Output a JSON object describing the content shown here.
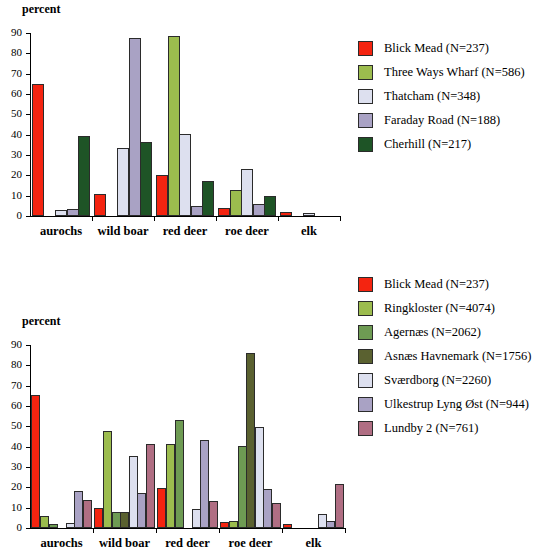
{
  "chart_data": [
    {
      "id": "top",
      "type": "bar",
      "title": "",
      "ylabel": "percent",
      "xlabel": "",
      "ylim": [
        0,
        90
      ],
      "yticks": [
        0,
        10,
        20,
        30,
        40,
        50,
        60,
        70,
        80,
        90
      ],
      "grid": false,
      "legend_position": "right",
      "categories": [
        "aurochs",
        "wild boar",
        "red deer",
        "roe deer",
        "elk"
      ],
      "series": [
        {
          "name": "Blick Mead (N=237)",
          "color": "#f42410",
          "values": [
            65,
            11,
            20,
            4,
            2
          ]
        },
        {
          "name": "Three Ways Wharf (N=586)",
          "color": "#9cbc4e",
          "values": [
            0,
            0,
            88.5,
            13,
            0
          ]
        },
        {
          "name": "Thatcham (N=348)",
          "color": "#dde0ef",
          "values": [
            3,
            33.5,
            40.5,
            23,
            1.5
          ]
        },
        {
          "name": "Faraday Road (N=188)",
          "color": "#a9a2c4",
          "values": [
            3.5,
            87.5,
            5,
            6,
            0
          ]
        },
        {
          "name": "Cherhill (N=217)",
          "color": "#1e5426",
          "values": [
            39.5,
            36.5,
            17,
            10,
            0
          ]
        }
      ]
    },
    {
      "id": "bottom",
      "type": "bar",
      "title": "",
      "ylabel": "percent",
      "xlabel": "",
      "ylim": [
        0,
        90
      ],
      "yticks": [
        0,
        10,
        20,
        30,
        40,
        50,
        60,
        70,
        80,
        90
      ],
      "grid": false,
      "legend_position": "right",
      "categories": [
        "aurochs",
        "wild boar",
        "red deer",
        "roe deer",
        "elk"
      ],
      "series": [
        {
          "name": "Blick Mead (N=237)",
          "color": "#f42410",
          "values": [
            65.5,
            10,
            19.5,
            3,
            2
          ]
        },
        {
          "name": "Ringkloster (N=4074)",
          "color": "#9cbc4e",
          "values": [
            6,
            47.5,
            41.5,
            3.5,
            0
          ]
        },
        {
          "name": "Agernæs (N=2062)",
          "color": "#6e9b53",
          "values": [
            2,
            8,
            53,
            40.5,
            0
          ]
        },
        {
          "name": "Asnæs Havnemark (N=1756)",
          "color": "#5a6130",
          "values": [
            0,
            8,
            0,
            86,
            0
          ]
        },
        {
          "name": "Sværdborg (N=2260)",
          "color": "#dde0ef",
          "values": [
            2.5,
            35.5,
            9.5,
            49.5,
            7
          ]
        },
        {
          "name": "Ulkestrup Lyng Øst (N=944)",
          "color": "#a9a2c4",
          "values": [
            18,
            17,
            43.5,
            19,
            3.5
          ]
        },
        {
          "name": "Lundby 2 (N=761)",
          "color": "#b06e83",
          "values": [
            14,
            41.5,
            13.5,
            12.5,
            21.5
          ]
        }
      ]
    }
  ]
}
